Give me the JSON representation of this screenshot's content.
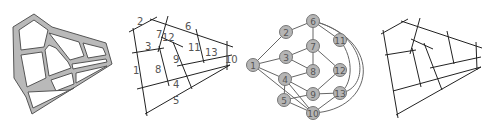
{
  "figure": {
    "panels": [
      {
        "id": "street-network-map",
        "description": "street network drawn as gray road polygons"
      },
      {
        "id": "numbered-street-segments",
        "description": "streets as lines labeled 1-13"
      },
      {
        "id": "dual-graph",
        "description": "graph with nodes 1-13 representing streets"
      },
      {
        "id": "unlabeled-axial-lines",
        "description": "axial lines without labels"
      }
    ],
    "colors": {
      "road_fill": "#b9b9b9",
      "road_outline": "#555555",
      "line": "#222222",
      "node_fill": "#b5b5b5",
      "node_stroke": "#777777",
      "edge": "#666666",
      "label": "#555555"
    },
    "street_labels": [
      {
        "text": "1",
        "x": 133,
        "y": 74
      },
      {
        "text": "2",
        "x": 137,
        "y": 25
      },
      {
        "text": "3",
        "x": 145,
        "y": 50
      },
      {
        "text": "4",
        "x": 173,
        "y": 88
      },
      {
        "text": "5",
        "x": 173,
        "y": 104
      },
      {
        "text": "6",
        "x": 185,
        "y": 30
      },
      {
        "text": "7",
        "x": 156,
        "y": 38
      },
      {
        "text": "8",
        "x": 155,
        "y": 73
      },
      {
        "text": "9",
        "x": 173,
        "y": 63
      },
      {
        "text": "10",
        "x": 225,
        "y": 63
      },
      {
        "text": "11",
        "x": 188,
        "y": 51
      },
      {
        "text": "12",
        "x": 162,
        "y": 41
      },
      {
        "text": "13",
        "x": 205,
        "y": 56
      }
    ],
    "graph": {
      "nodes": [
        {
          "id": "1",
          "x": 253,
          "y": 65
        },
        {
          "id": "2",
          "x": 286,
          "y": 32
        },
        {
          "id": "3",
          "x": 286,
          "y": 57
        },
        {
          "id": "4",
          "x": 285,
          "y": 79
        },
        {
          "id": "5",
          "x": 284,
          "y": 100
        },
        {
          "id": "6",
          "x": 313,
          "y": 21
        },
        {
          "id": "7",
          "x": 313,
          "y": 46
        },
        {
          "id": "8",
          "x": 313,
          "y": 71
        },
        {
          "id": "9",
          "x": 313,
          "y": 94
        },
        {
          "id": "10",
          "x": 313,
          "y": 113
        },
        {
          "id": "11",
          "x": 340,
          "y": 40
        },
        {
          "id": "12",
          "x": 340,
          "y": 70
        },
        {
          "id": "13",
          "x": 340,
          "y": 93
        }
      ],
      "edges": [
        [
          "1",
          "2"
        ],
        [
          "1",
          "3"
        ],
        [
          "1",
          "4"
        ],
        [
          "1",
          "10"
        ],
        [
          "2",
          "6"
        ],
        [
          "3",
          "7"
        ],
        [
          "3",
          "8"
        ],
        [
          "4",
          "8"
        ],
        [
          "4",
          "9"
        ],
        [
          "4",
          "5"
        ],
        [
          "4",
          "10"
        ],
        [
          "5",
          "9"
        ],
        [
          "5",
          "10"
        ],
        [
          "6",
          "7"
        ],
        [
          "6",
          "11"
        ],
        [
          "7",
          "8"
        ],
        [
          "7",
          "12"
        ],
        [
          "9",
          "12"
        ],
        [
          "9",
          "13"
        ],
        [
          "10",
          "13"
        ]
      ],
      "curved_edges": [
        [
          "6",
          "13"
        ],
        [
          "6",
          "10"
        ],
        [
          "11",
          "13"
        ]
      ]
    }
  }
}
